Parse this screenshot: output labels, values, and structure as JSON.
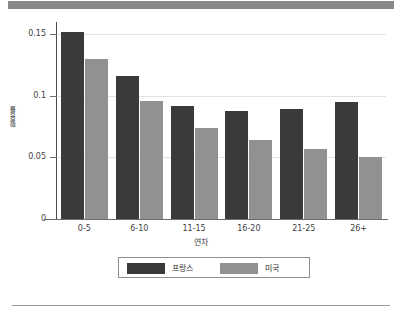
{
  "chart_data": {
    "type": "bar",
    "title": "",
    "subtitle": "",
    "xlabel": "연차",
    "ylabel": "활용률",
    "categories": [
      "0-5",
      "6-10",
      "11-15",
      "16-20",
      "21-25",
      "26+"
    ],
    "series": [
      {
        "name": "프랑스",
        "color": "#3a3a3a",
        "values": [
          0.152,
          0.116,
          0.092,
          0.088,
          0.089,
          0.095
        ]
      },
      {
        "name": "미국",
        "color": "#919191",
        "values": [
          0.13,
          0.096,
          0.074,
          0.064,
          0.057,
          0.05
        ]
      }
    ],
    "ylim": [
      0,
      0.16
    ],
    "ytick_values": [
      0,
      0.05,
      0.1,
      0.15
    ],
    "ytick_labels": [
      "0",
      "0.05",
      "0.1",
      "0.15"
    ],
    "grid": true,
    "grid_axis": "y",
    "legend_position": "bottom",
    "annotations": []
  },
  "figure": {
    "top_band_color": "#8a8a8a",
    "background_color": "#ffffff",
    "axis_color": "#4a4a4a",
    "grid_color": "#e2e2e2",
    "bottom_rule_color": "#9a9a9a"
  }
}
